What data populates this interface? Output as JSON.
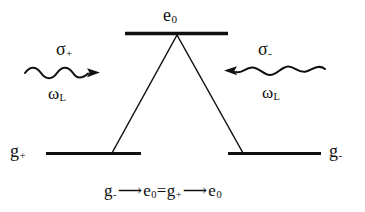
{
  "figure": {
    "type": "energy-level-lambda-diagram",
    "background_color": "#ffffff",
    "ink_color": "#101010",
    "width": 365,
    "height": 212
  },
  "levels": {
    "excited": {
      "label_base": "e",
      "label_sub": "0",
      "label_full": "e0",
      "x1": 125,
      "x2": 228,
      "y": 33
    },
    "ground_left": {
      "label_base": "g",
      "label_sub": "+",
      "label_full": "g+",
      "x1": 46,
      "x2": 141,
      "y": 153
    },
    "ground_right": {
      "label_base": "g",
      "label_sub": "-",
      "label_full": "g-",
      "x1": 228,
      "x2": 321,
      "y": 153
    }
  },
  "transitions": {
    "apex_x": 177,
    "apex_y": 35,
    "left_foot_x": 112,
    "left_foot_y": 153,
    "right_foot_x": 243,
    "right_foot_y": 153
  },
  "left_beam": {
    "polarization_base": "σ",
    "polarization_sub": "+",
    "polarization_full": "σ+",
    "frequency_base": "ω",
    "frequency_sub": "L",
    "frequency_full": "ωL",
    "direction": "right",
    "wave_x_start": 25,
    "wave_x_end": 100,
    "wave_y": 72
  },
  "right_beam": {
    "polarization_base": "σ",
    "polarization_sub": "-",
    "polarization_full": "σ-",
    "frequency_base": "ω",
    "frequency_sub": "L",
    "frequency_full": "ωL",
    "direction": "left",
    "wave_x_start": 224,
    "wave_x_end": 325,
    "wave_y": 70
  },
  "caption": {
    "term1_base": "g",
    "term1_sub": "-",
    "arrow1": "⟶",
    "term2_base": "e",
    "term2_sub": "0",
    "equals": "=",
    "term3_base": "g",
    "term3_sub": "+",
    "arrow2": "⟶",
    "term4_base": "e",
    "term4_sub": "0",
    "full_text": "g- ⟶ e0 = g+ ⟶ e0"
  }
}
